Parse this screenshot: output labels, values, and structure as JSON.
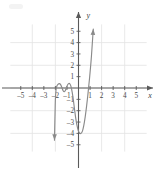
{
  "chart_data": {
    "type": "line",
    "title": "",
    "xlabel": "x",
    "ylabel": "y",
    "xlim": [
      -5.9,
      5.9
    ],
    "ylim": [
      -5.6,
      5.6
    ],
    "grid": true,
    "grid_spacing": 2,
    "legend": null,
    "x_ticks": [
      -5,
      -4,
      -3,
      -2,
      -1,
      1,
      2,
      3,
      4,
      5
    ],
    "y_ticks": [
      -5,
      -4,
      -3,
      -2,
      -1,
      1,
      2,
      3,
      4,
      5
    ],
    "x_tick_labels": [
      "-5",
      "-4",
      "-3",
      "-2",
      "-1",
      "1",
      "2",
      "3",
      "4",
      "5"
    ],
    "y_tick_labels": [
      "-5",
      "-4",
      "-3",
      "-2",
      "-1",
      "1",
      "2",
      "3",
      "4",
      "5"
    ],
    "series": [
      {
        "name": "polynomial-curve",
        "color": "#8a8a8a",
        "arrow_start": true,
        "arrow_end": true,
        "points": [
          [
            -2.08,
            -4.6
          ],
          [
            -2.06,
            -3.5
          ],
          [
            -2.03,
            -2.2
          ],
          [
            -2.0,
            -1.0
          ],
          [
            -1.95,
            -0.2
          ],
          [
            -1.88,
            0.15
          ],
          [
            -1.78,
            0.32
          ],
          [
            -1.66,
            0.38
          ],
          [
            -1.55,
            0.3
          ],
          [
            -1.44,
            0.05
          ],
          [
            -1.34,
            -0.22
          ],
          [
            -1.24,
            -0.33
          ],
          [
            -1.14,
            -0.22
          ],
          [
            -1.04,
            0.05
          ],
          [
            -0.94,
            0.28
          ],
          [
            -0.84,
            0.4
          ],
          [
            -0.74,
            0.35
          ],
          [
            -0.64,
            0.1
          ],
          [
            -0.54,
            -0.4
          ],
          [
            -0.44,
            -1.1
          ],
          [
            -0.34,
            -1.9
          ],
          [
            -0.24,
            -2.65
          ],
          [
            -0.14,
            -3.25
          ],
          [
            -0.02,
            -3.75
          ],
          [
            0.1,
            -3.97
          ],
          [
            0.22,
            -4.0
          ],
          [
            0.34,
            -3.8
          ],
          [
            0.46,
            -3.3
          ],
          [
            0.58,
            -2.55
          ],
          [
            0.7,
            -1.6
          ],
          [
            0.8,
            -0.7
          ],
          [
            0.88,
            0.1
          ],
          [
            0.96,
            0.9
          ],
          [
            1.04,
            1.8
          ],
          [
            1.12,
            2.8
          ],
          [
            1.18,
            3.7
          ],
          [
            1.24,
            4.6
          ],
          [
            1.28,
            5.2
          ]
        ]
      }
    ],
    "annotations": [
      {
        "kind": "zero-crossing",
        "x": -2.0
      },
      {
        "kind": "zero-crossing",
        "x": -1.9
      },
      {
        "kind": "zero-crossing",
        "x": -1.45
      },
      {
        "kind": "zero-crossing",
        "x": -1.05
      },
      {
        "kind": "zero-crossing",
        "x": -0.62
      },
      {
        "kind": "zero-crossing",
        "x": 0.87
      },
      {
        "kind": "local-max",
        "x": -1.66,
        "y": 0.38
      },
      {
        "kind": "local-min",
        "x": -1.24,
        "y": -0.33
      },
      {
        "kind": "local-max",
        "x": -0.84,
        "y": 0.4
      },
      {
        "kind": "local-min",
        "x": 0.22,
        "y": -4.0
      }
    ]
  },
  "axes": {
    "x_axis_label": "x",
    "y_axis_label": "y"
  }
}
